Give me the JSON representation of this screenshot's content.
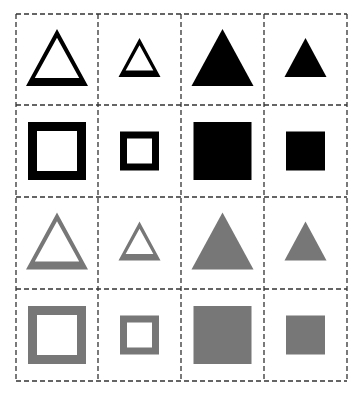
{
  "colors": {
    "black": "#000000",
    "gray": "#777777",
    "grid": "#333333",
    "background": "#ffffff"
  },
  "grid": {
    "x": [
      16,
      98,
      181,
      264,
      347
    ],
    "y": [
      14,
      105,
      197,
      289,
      381
    ]
  },
  "cells": [
    {
      "row": 0,
      "col": 0,
      "shape": "triangle",
      "size": "large",
      "fill": "outline",
      "color": "black"
    },
    {
      "row": 0,
      "col": 1,
      "shape": "triangle",
      "size": "small",
      "fill": "outline",
      "color": "black"
    },
    {
      "row": 0,
      "col": 2,
      "shape": "triangle",
      "size": "large",
      "fill": "solid",
      "color": "black"
    },
    {
      "row": 0,
      "col": 3,
      "shape": "triangle",
      "size": "small",
      "fill": "solid",
      "color": "black"
    },
    {
      "row": 1,
      "col": 0,
      "shape": "square",
      "size": "large",
      "fill": "outline",
      "color": "black"
    },
    {
      "row": 1,
      "col": 1,
      "shape": "square",
      "size": "small",
      "fill": "outline",
      "color": "black"
    },
    {
      "row": 1,
      "col": 2,
      "shape": "square",
      "size": "large",
      "fill": "solid",
      "color": "black"
    },
    {
      "row": 1,
      "col": 3,
      "shape": "square",
      "size": "small",
      "fill": "solid",
      "color": "black"
    },
    {
      "row": 2,
      "col": 0,
      "shape": "triangle",
      "size": "large",
      "fill": "outline",
      "color": "gray"
    },
    {
      "row": 2,
      "col": 1,
      "shape": "triangle",
      "size": "small",
      "fill": "outline",
      "color": "gray"
    },
    {
      "row": 2,
      "col": 2,
      "shape": "triangle",
      "size": "large",
      "fill": "solid",
      "color": "gray"
    },
    {
      "row": 2,
      "col": 3,
      "shape": "triangle",
      "size": "small",
      "fill": "solid",
      "color": "gray"
    },
    {
      "row": 3,
      "col": 0,
      "shape": "square",
      "size": "large",
      "fill": "outline",
      "color": "gray"
    },
    {
      "row": 3,
      "col": 1,
      "shape": "square",
      "size": "small",
      "fill": "outline",
      "color": "gray"
    },
    {
      "row": 3,
      "col": 2,
      "shape": "square",
      "size": "large",
      "fill": "solid",
      "color": "gray"
    },
    {
      "row": 3,
      "col": 3,
      "shape": "square",
      "size": "small",
      "fill": "solid",
      "color": "gray"
    }
  ]
}
